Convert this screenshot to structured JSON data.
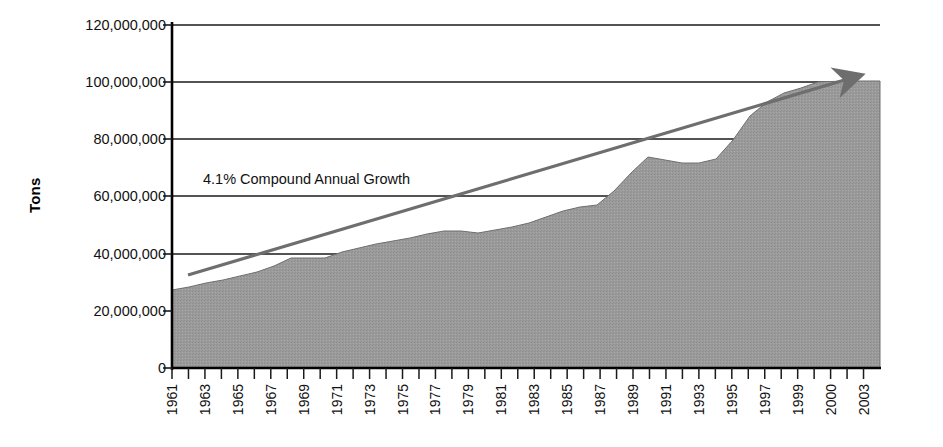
{
  "chart_data": {
    "type": "area",
    "title": "",
    "subtitle": "",
    "xlabel": "",
    "ylabel": "Tons",
    "ylim": [
      0,
      120000000
    ],
    "xlim": [
      1961,
      2003
    ],
    "grid": true,
    "legend": false,
    "legend_position": "none",
    "y_ticks": [
      "120,000,000",
      "100,000,000",
      "80,000,000",
      "60,000,000",
      "40,000,000",
      "20,000,000",
      "0"
    ],
    "y_tick_values": [
      120000000,
      100000000,
      80000000,
      60000000,
      40000000,
      20000000,
      0
    ],
    "x_tick_labels": [
      "1961",
      "1963",
      "1965",
      "1967",
      "1969",
      "1971",
      "1973",
      "1975",
      "1977",
      "1979",
      "1981",
      "1983",
      "1985",
      "1987",
      "1989",
      "1991",
      "1993",
      "1995",
      "1997",
      "1999",
      "2000",
      "2003"
    ],
    "series": [
      {
        "name": "Tons",
        "kind": "area",
        "color": "#9a9a9a",
        "x": [
          1961,
          1962,
          1963,
          1964,
          1965,
          1966,
          1967,
          1968,
          1969,
          1970,
          1971,
          1972,
          1973,
          1974,
          1975,
          1976,
          1977,
          1978,
          1979,
          1980,
          1981,
          1982,
          1983,
          1984,
          1985,
          1986,
          1987,
          1988,
          1989,
          1990,
          1991,
          1992,
          1993,
          1994,
          1995,
          1996,
          1997,
          1998,
          1999,
          2000,
          2003
        ],
        "values": [
          27000000,
          28000000,
          29500000,
          30500000,
          32000000,
          33500000,
          35500000,
          38500000,
          38500000,
          38500000,
          40500000,
          42000000,
          43500000,
          44500000,
          45500000,
          47000000,
          48000000,
          48000000,
          47500000,
          48500000,
          49500000,
          51000000,
          53000000,
          55000000,
          56500000,
          57000000,
          62000000,
          68000000,
          73500000,
          72500000,
          71500000,
          71500000,
          73000000,
          79500000,
          88000000,
          93000000,
          96000000,
          98000000,
          100000000,
          100500000,
          100500000
        ]
      },
      {
        "name": "4.1% Compound Annual Growth",
        "kind": "trendline",
        "color": "#6e6e6e",
        "arrow": true,
        "start": {
          "x": 1961,
          "y": 32500000
        },
        "end": {
          "x": 2000,
          "y": 101500000
        }
      }
    ],
    "annotations": [
      {
        "name": "growth-annotation",
        "text": "4.1% Compound Annual Growth",
        "x": 1966.5,
        "y": 63500000
      }
    ]
  },
  "axis": {
    "y_title": "Tons"
  }
}
